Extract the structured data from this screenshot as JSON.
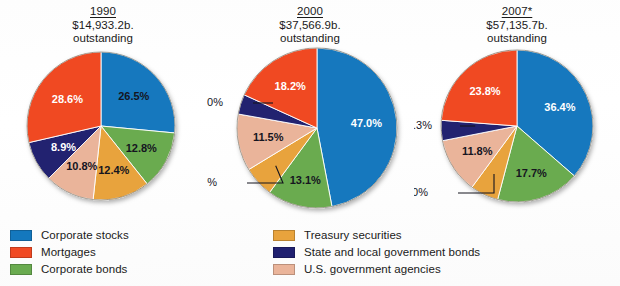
{
  "colors": {
    "corporate_stocks": "#1478be",
    "mortgages": "#f04a23",
    "corporate_bonds": "#6aab50",
    "treasury_securities": "#e8a33d",
    "state_local_bonds": "#202070",
    "us_govt_agencies": "#eab49a",
    "text": "#15151f",
    "background": "#ffffff"
  },
  "legend": {
    "left_column": [
      {
        "label": "Corporate stocks",
        "color": "#1478be",
        "key": "corporate_stocks"
      },
      {
        "label": "Mortgages",
        "color": "#f04a23",
        "key": "mortgages"
      },
      {
        "label": "Corporate bonds",
        "color": "#6aab50",
        "key": "corporate_bonds"
      }
    ],
    "right_column": [
      {
        "label": "Treasury securities",
        "color": "#e8a33d",
        "key": "treasury_securities"
      },
      {
        "label": "State and local government bonds",
        "color": "#202070",
        "key": "state_local_bonds"
      },
      {
        "label": "U.S. government agencies",
        "color": "#eab49a",
        "key": "us_govt_agencies"
      }
    ]
  },
  "chart_data": [
    {
      "type": "pie",
      "title": "1990",
      "subtitle": "$14,933.2b.",
      "note": "outstanding",
      "total_label": "$14,933.2b. outstanding",
      "categories": [
        "Corporate stocks",
        "Corporate bonds",
        "Treasury securities",
        "U.S. government agencies",
        "State and local government bonds",
        "Mortgages"
      ],
      "values": [
        26.5,
        12.8,
        12.4,
        10.8,
        8.9,
        28.6
      ],
      "labels": [
        "26.5%",
        "12.8%",
        "12.4%",
        "10.8%",
        "8.9%",
        "28.6%"
      ],
      "colors": [
        "#1478be",
        "#6aab50",
        "#e8a33d",
        "#eab49a",
        "#202070",
        "#f04a23"
      ],
      "label_colors": [
        "dark",
        "dark",
        "dark",
        "dark",
        "light",
        "light"
      ],
      "label_modes": [
        "inside",
        "inside",
        "inside",
        "inside",
        "inside",
        "inside"
      ],
      "label_radius": [
        0.6,
        0.62,
        0.62,
        0.6,
        0.58,
        0.58
      ]
    },
    {
      "type": "pie",
      "title": "2000",
      "subtitle": "$37,566.9b.",
      "note": "outstanding",
      "total_label": "$37,566.9b. outstanding",
      "categories": [
        "Corporate stocks",
        "Corporate bonds",
        "Treasury securities",
        "U.S. government agencies",
        "State and local government bonds",
        "Mortgages"
      ],
      "values": [
        47.0,
        13.1,
        6.2,
        11.5,
        4.0,
        18.2
      ],
      "labels": [
        "47.0%",
        "13.1%",
        "6.2%",
        "11.5%",
        "4.0%",
        "18.2%"
      ],
      "colors": [
        "#1478be",
        "#6aab50",
        "#e8a33d",
        "#eab49a",
        "#202070",
        "#f04a23"
      ],
      "label_colors": [
        "light",
        "dark",
        "dark",
        "dark",
        "dark",
        "light"
      ],
      "label_modes": [
        "inside",
        "inside",
        "callout",
        "inside",
        "callout",
        "inside"
      ],
      "label_radius": [
        0.62,
        0.66,
        0.62,
        0.62,
        0.62,
        0.62
      ]
    },
    {
      "type": "pie",
      "title": "2007*",
      "subtitle": "$57,135.7b.",
      "note": "outstanding",
      "total_label": "$57,135.7b. outstanding",
      "categories": [
        "Corporate stocks",
        "Corporate bonds",
        "Treasury securities",
        "U.S. government agencies",
        "State and local government bonds",
        "Mortgages"
      ],
      "values": [
        36.4,
        17.7,
        6.0,
        11.8,
        4.3,
        23.8
      ],
      "labels": [
        "36.4%",
        "17.7%",
        "6.0%",
        "11.8%",
        "4.3%",
        "23.8%"
      ],
      "colors": [
        "#1478be",
        "#6aab50",
        "#e8a33d",
        "#eab49a",
        "#202070",
        "#f04a23"
      ],
      "label_colors": [
        "light",
        "dark",
        "dark",
        "dark",
        "dark",
        "light"
      ],
      "label_modes": [
        "inside",
        "inside",
        "callout",
        "inside",
        "callout",
        "inside"
      ],
      "label_radius": [
        0.62,
        0.64,
        0.62,
        0.62,
        0.62,
        0.62
      ]
    }
  ]
}
